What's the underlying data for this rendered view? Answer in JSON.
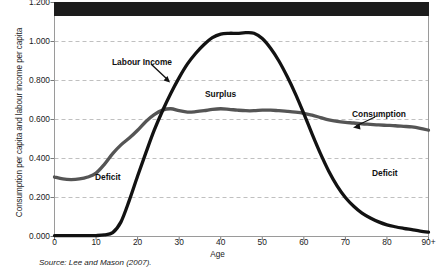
{
  "figure": {
    "source_note": "Source: Lee and Mason (2007).",
    "title_band": {
      "visible": true,
      "text": "",
      "color": "#1c1c1c"
    }
  },
  "chart_data": {
    "type": "line",
    "title": "",
    "xlabel": "Age",
    "ylabel": "Consumption per capita and labour income per capita",
    "xlim": [
      0,
      90
    ],
    "ylim": [
      0.0,
      1.2
    ],
    "xticks": [
      0,
      10,
      20,
      30,
      40,
      50,
      60,
      70,
      80,
      90
    ],
    "xticklabels": [
      "0",
      "10",
      "20",
      "30",
      "40",
      "50",
      "60",
      "70",
      "80",
      "90+"
    ],
    "yticks": [
      0.0,
      0.2,
      0.4,
      0.6,
      0.8,
      1.0,
      1.2
    ],
    "yticklabels": [
      "0.000",
      "0.200",
      "0.400",
      "0.600",
      "0.800",
      "1.000",
      "1.200"
    ],
    "grid": true,
    "grid_style": "dashed",
    "grid_color": "#b9b9b9",
    "legend": "none",
    "x": [
      0,
      2,
      4,
      6,
      8,
      10,
      12,
      14,
      16,
      18,
      20,
      22,
      24,
      26,
      28,
      30,
      32,
      34,
      36,
      38,
      40,
      42,
      44,
      46,
      48,
      50,
      52,
      54,
      56,
      58,
      60,
      62,
      64,
      66,
      68,
      70,
      72,
      74,
      76,
      78,
      80,
      82,
      84,
      86,
      88,
      90
    ],
    "series": [
      {
        "name": "Labour Income",
        "color": "#121212",
        "width": 3.3,
        "values": [
          0.005,
          0.005,
          0.005,
          0.005,
          0.005,
          0.005,
          0.008,
          0.02,
          0.075,
          0.185,
          0.31,
          0.43,
          0.545,
          0.645,
          0.735,
          0.815,
          0.885,
          0.94,
          0.985,
          1.02,
          1.038,
          1.042,
          1.042,
          1.045,
          1.042,
          1.015,
          0.965,
          0.9,
          0.82,
          0.73,
          0.63,
          0.525,
          0.425,
          0.335,
          0.26,
          0.2,
          0.155,
          0.12,
          0.095,
          0.075,
          0.06,
          0.05,
          0.042,
          0.035,
          0.028,
          0.022
        ]
      },
      {
        "name": "Consumption",
        "color": "#555555",
        "width": 3.3,
        "values": [
          0.305,
          0.295,
          0.292,
          0.295,
          0.305,
          0.325,
          0.37,
          0.425,
          0.47,
          0.505,
          0.545,
          0.59,
          0.625,
          0.648,
          0.655,
          0.645,
          0.638,
          0.64,
          0.645,
          0.652,
          0.655,
          0.652,
          0.648,
          0.645,
          0.645,
          0.648,
          0.648,
          0.645,
          0.642,
          0.638,
          0.632,
          0.622,
          0.61,
          0.598,
          0.59,
          0.585,
          0.582,
          0.578,
          0.575,
          0.572,
          0.57,
          0.568,
          0.565,
          0.562,
          0.555,
          0.545
        ]
      }
    ],
    "annotations": [
      {
        "name": "labour-income-label",
        "text": "Labour Income",
        "x": 16,
        "y": 0.905,
        "arrow_to": {
          "x": 25.5,
          "y": 0.725
        }
      },
      {
        "name": "surplus-label",
        "text": "Surplus",
        "x": 40,
        "y": 0.745,
        "arrow_to": null
      },
      {
        "name": "consumption-label",
        "text": "Consumption",
        "x": 79,
        "y": 0.655,
        "arrow_to": {
          "x": 70.5,
          "y": 0.57
        }
      },
      {
        "name": "deficit-left-label",
        "text": "Deficit",
        "x": 11,
        "y": 0.345,
        "arrow_to": null
      },
      {
        "name": "deficit-right-label",
        "text": "Deficit",
        "x": 82,
        "y": 0.37,
        "arrow_to": null
      }
    ]
  }
}
